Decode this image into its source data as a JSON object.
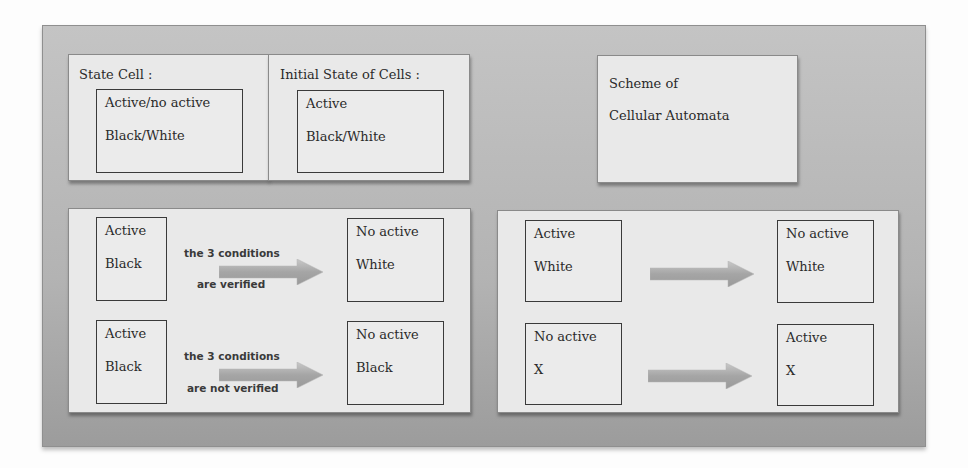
{
  "top": {
    "state_cell": {
      "title": "State Cell :",
      "box": {
        "line1": "Active/no active",
        "line2": "Black/White"
      }
    },
    "initial_state": {
      "title": "Initial State of Cells :",
      "box": {
        "line1": "Active",
        "line2": "Black/White"
      }
    },
    "scheme": {
      "line1": "Scheme of",
      "line2": "Cellular Automata"
    }
  },
  "rules_left": {
    "rows": [
      {
        "from": {
          "line1": "Active",
          "line2": "Black"
        },
        "condition_top": "the 3 conditions",
        "condition_bottom": "are verified",
        "to": {
          "line1": "No active",
          "line2": "White"
        }
      },
      {
        "from": {
          "line1": "Active",
          "line2": "Black"
        },
        "condition_top": "the 3 conditions",
        "condition_bottom": "are not verified",
        "to": {
          "line1": "No active",
          "line2": "Black"
        }
      }
    ]
  },
  "rules_right": {
    "rows": [
      {
        "from": {
          "line1": "Active",
          "line2": "White"
        },
        "to": {
          "line1": "No active",
          "line2": "White"
        }
      },
      {
        "from": {
          "line1": "No active",
          "line2": "X"
        },
        "to": {
          "line1": "Active",
          "line2": "X"
        }
      }
    ]
  },
  "icons": {
    "arrow": "right-arrow-icon"
  },
  "colors": {
    "frame": "#b3b3b3",
    "panel": "#e9e9e9",
    "arrow": "#a8a8a8",
    "border": "#3a3a3a"
  }
}
